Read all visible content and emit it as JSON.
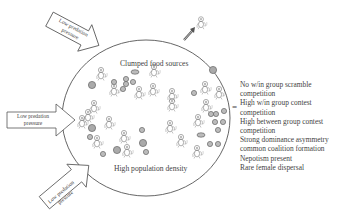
{
  "diagram": {
    "arrows": [
      {
        "label": "Low predation pressure",
        "position": "top-left"
      },
      {
        "label": "Low predation pressure",
        "position": "left"
      },
      {
        "label": "Low predation pressure",
        "position": "bottom-left"
      }
    ],
    "circle_labels": {
      "top": "Clumped food sources",
      "bottom": "High population density"
    },
    "equals_sign": "=",
    "outcomes": [
      "No w/in group scramble",
      "competition",
      "High w/in group contest",
      "competition",
      "High between group contest",
      "competition",
      "Strong dominance asymmetry",
      "common coalition formation",
      "Nepotism present",
      "Rare female dispersal"
    ],
    "icons": {
      "animal": "monkey-icon",
      "food": "food-source-icon",
      "dispersal_arrow": "dispersal-arrow-icon"
    }
  }
}
